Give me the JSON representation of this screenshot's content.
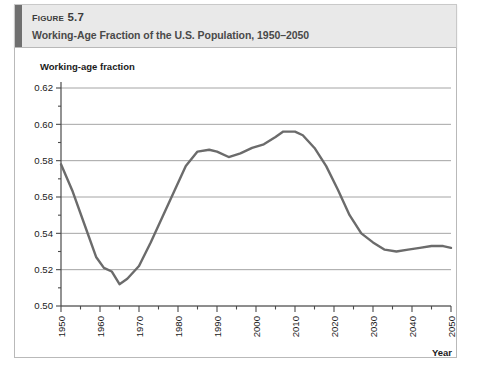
{
  "figure": {
    "number_prefix": "Figure",
    "number": "5.7",
    "title": "Working-Age Fraction of the U.S. Population, 1950–2050",
    "accent_color": "#6f6f6f",
    "header_bg": "#e9e9e9"
  },
  "chart_data": {
    "type": "line",
    "title": "Working-Age Fraction of the U.S. Population, 1950–2050",
    "xlabel": "Year",
    "ylabel": "Working-age fraction",
    "xlim": [
      1950,
      2050
    ],
    "ylim": [
      0.5,
      0.62
    ],
    "grid": "horizontal",
    "legend": "none",
    "line_color": "#6b6b6b",
    "y_ticks": [
      "0.50",
      "0.52",
      "0.54",
      "0.56",
      "0.58",
      "0.60",
      "0.62"
    ],
    "y_tick_values": [
      0.5,
      0.52,
      0.54,
      0.56,
      0.58,
      0.6,
      0.62
    ],
    "y_minor_tick_values": [
      0.51,
      0.53,
      0.55,
      0.57,
      0.59,
      0.61
    ],
    "x_ticks": [
      "1950",
      "1960",
      "1970",
      "1980",
      "1990",
      "2000",
      "2010",
      "2020",
      "2030",
      "2040",
      "2050"
    ],
    "x_tick_values": [
      1950,
      1960,
      1970,
      1980,
      1990,
      2000,
      2010,
      2020,
      2030,
      2040,
      2050
    ],
    "x_minor_tick_values": [
      1955,
      1965,
      1975,
      1985,
      1995,
      2005,
      2015,
      2025,
      2035,
      2045
    ],
    "series": [
      {
        "name": "Working-age fraction",
        "x": [
          1950,
          1953,
          1956,
          1959,
          1961,
          1963,
          1965,
          1967,
          1970,
          1973,
          1976,
          1979,
          1982,
          1985,
          1988,
          1990,
          1993,
          1996,
          1999,
          2002,
          2005,
          2007,
          2010,
          2012,
          2015,
          2018,
          2021,
          2024,
          2027,
          2030,
          2033,
          2036,
          2039,
          2042,
          2045,
          2048,
          2050
        ],
        "values": [
          0.578,
          0.563,
          0.545,
          0.527,
          0.521,
          0.519,
          0.512,
          0.515,
          0.522,
          0.535,
          0.549,
          0.563,
          0.577,
          0.585,
          0.586,
          0.585,
          0.582,
          0.584,
          0.587,
          0.589,
          0.593,
          0.596,
          0.596,
          0.594,
          0.587,
          0.577,
          0.564,
          0.55,
          0.54,
          0.535,
          0.531,
          0.53,
          0.531,
          0.532,
          0.533,
          0.533,
          0.532
        ]
      }
    ]
  }
}
